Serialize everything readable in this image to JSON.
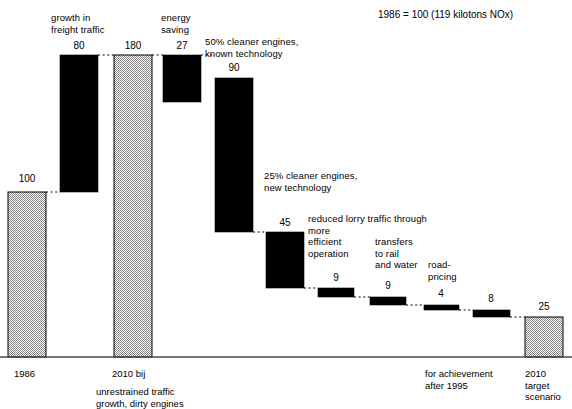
{
  "title": "1986 = 100 (119 kilotons NOx)",
  "chart_data": {
    "type": "bar",
    "title": "1986 = 100 (119 kilotons NOx)",
    "subtitle": "",
    "xlabel": "",
    "ylabel": "",
    "ylim": [
      0,
      190
    ],
    "grid": false,
    "legend": "none",
    "note": "Waterfall chart of NOx emissions index; grey bars are totals, black bars are increments/decrements.",
    "categories": [
      "1986",
      "growth in freight traffic",
      "2010 bij",
      "energy saving",
      "50% cleaner engines, known technology",
      "25% cleaner engines, new technology",
      "reduced lorry traffic through more efficient operation",
      "transfers to rail and water",
      "road-pricing",
      "",
      "2010 target scenario"
    ],
    "values": [
      100,
      80,
      180,
      27,
      90,
      45,
      9,
      9,
      4,
      8,
      25
    ],
    "bars": [
      {
        "index": 0,
        "label": "",
        "value": 100,
        "value_text": "100",
        "kind": "total",
        "fill": "hatch",
        "x": 8,
        "w": 38,
        "top": 192,
        "bottom": 357
      },
      {
        "index": 1,
        "label": "growth in\nfreight traffic",
        "value": 80,
        "value_text": "80",
        "kind": "increase",
        "fill": "solid",
        "x": 60,
        "w": 38,
        "top": 55,
        "bottom": 192
      },
      {
        "index": 2,
        "label": "",
        "value": 180,
        "value_text": "180",
        "kind": "total",
        "fill": "hatch",
        "x": 114,
        "w": 38,
        "top": 55,
        "bottom": 357
      },
      {
        "index": 3,
        "label": "energy\nsaving",
        "value": 27,
        "value_text": "27",
        "kind": "decrease",
        "fill": "solid",
        "x": 163,
        "w": 38,
        "top": 55,
        "bottom": 102
      },
      {
        "index": 4,
        "label": "50% cleaner engines,\nknown technology",
        "value": 90,
        "value_text": "90",
        "kind": "decrease",
        "fill": "solid",
        "x": 215,
        "w": 38,
        "top": 78,
        "bottom": 232
      },
      {
        "index": 5,
        "label": "25% cleaner engines,\nnew technology",
        "value": 45,
        "value_text": "45",
        "kind": "decrease",
        "fill": "solid",
        "x": 266,
        "w": 38,
        "top": 232,
        "bottom": 288
      },
      {
        "index": 6,
        "label": "reduced lorry traffic through\nmore\nefficient\noperation",
        "value": 9,
        "value_text": "9",
        "kind": "decrease",
        "fill": "solid",
        "x": 318,
        "w": 36,
        "top": 288,
        "bottom": 297
      },
      {
        "index": 7,
        "label": "transfers\nto rail\nand water",
        "value": 9,
        "value_text": "9",
        "kind": "decrease",
        "fill": "solid",
        "x": 370,
        "w": 36,
        "top": 297,
        "bottom": 305
      },
      {
        "index": 8,
        "label": "road-\npricing",
        "value": 4,
        "value_text": "4",
        "kind": "decrease",
        "fill": "solid",
        "x": 424,
        "w": 35,
        "top": 305,
        "bottom": 310
      },
      {
        "index": 9,
        "label": "",
        "value": 8,
        "value_text": "8",
        "kind": "decrease",
        "fill": "solid",
        "x": 473,
        "w": 37,
        "top": 310,
        "bottom": 317
      },
      {
        "index": 10,
        "label": "",
        "value": 25,
        "value_text": "25",
        "kind": "total",
        "fill": "hatch",
        "x": 525,
        "w": 38,
        "top": 317,
        "bottom": 357
      }
    ]
  },
  "value_labels": [
    {
      "text": "100",
      "cx": 27,
      "y": 173
    },
    {
      "text": "80",
      "cx": 79,
      "y": 40
    },
    {
      "text": "180",
      "cx": 133,
      "y": 40
    },
    {
      "text": "27",
      "cx": 182,
      "y": 40
    },
    {
      "text": "90",
      "cx": 234,
      "y": 62
    },
    {
      "text": "45",
      "cx": 285,
      "y": 217
    },
    {
      "text": "9",
      "cx": 336,
      "y": 272
    },
    {
      "text": "9",
      "cx": 388,
      "y": 280
    },
    {
      "text": "4",
      "cx": 441,
      "y": 288
    },
    {
      "text": "8",
      "cx": 491,
      "y": 293
    },
    {
      "text": "25",
      "cx": 544,
      "y": 301
    }
  ],
  "callouts": [
    {
      "name": "growth-in-freight-traffic",
      "text": "growth in\nfreight traffic",
      "x": 51,
      "y": 12
    },
    {
      "name": "energy-saving",
      "text": "energy\nsaving",
      "x": 161,
      "y": 12
    },
    {
      "name": "cleaner-engines-known",
      "text": "50% cleaner engines,\nknown technology",
      "x": 205,
      "y": 36
    },
    {
      "name": "cleaner-engines-new",
      "text": "25% cleaner engines,\nnew technology",
      "x": 264,
      "y": 170
    },
    {
      "name": "reduced-lorry-traffic",
      "text": "reduced lorry traffic through\nmore\nefficient\noperation",
      "x": 308,
      "y": 213
    },
    {
      "name": "transfers-to-rail-water",
      "text": "transfers\nto rail\nand water",
      "x": 375,
      "y": 236
    },
    {
      "name": "road-pricing",
      "text": "road-\npricing",
      "x": 428,
      "y": 259
    }
  ],
  "axis_labels": [
    {
      "name": "axis-label-1986",
      "text": "1986",
      "x": 14,
      "y": 368
    },
    {
      "name": "axis-label-2010-bij",
      "text": "2010 bij",
      "x": 112,
      "y": 368
    },
    {
      "name": "axis-label-unrestrained",
      "text": "unrestrained traffic\ngrowth, dirty engines",
      "x": 96,
      "y": 386
    },
    {
      "name": "axis-label-for-achievement",
      "text": "for achievement\nafter 1995",
      "x": 425,
      "y": 368
    },
    {
      "name": "axis-label-2010-target",
      "text": "2010\ntarget\nscenario",
      "x": 525,
      "y": 368
    }
  ],
  "colors": {
    "ink": "#000000",
    "grey_fill": "#b0b0b0",
    "bar_stroke": "#000000",
    "baseline": "#4a4a4a"
  },
  "geometry": {
    "baseline_y": 357,
    "baseline_x0": 0,
    "baseline_x1": 572
  }
}
